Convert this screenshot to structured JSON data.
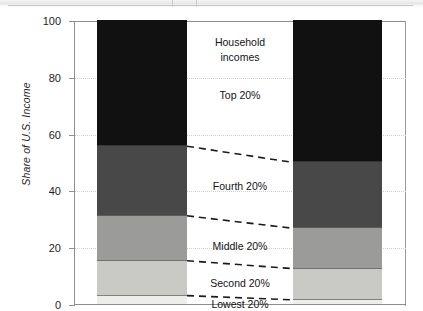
{
  "chart_data": {
    "type": "bar",
    "subtype": "stacked-100-percent",
    "title": "",
    "xlabel": "",
    "ylabel": "Share of U.S. Income",
    "ylim": [
      0,
      100
    ],
    "yticks": [
      0,
      20,
      40,
      60,
      80,
      100
    ],
    "ytick_labels": [
      "0",
      "20",
      "40",
      "60",
      "80",
      "100"
    ],
    "grid": true,
    "grid_style": "dotted-horizontal",
    "legend_position": "inline-center",
    "categories": [
      "",
      ""
    ],
    "series": [
      {
        "name": "Lowest 20%",
        "values": [
          3.3,
          1.8
        ],
        "color": "#ededeb"
      },
      {
        "name": "Second 20%",
        "values": [
          12.3,
          11.0
        ],
        "color": "#c9c9c6"
      },
      {
        "name": "Middle 20%",
        "values": [
          15.8,
          14.2
        ],
        "color": "#9b9b99"
      },
      {
        "name": "Fourth 20%",
        "values": [
          24.5,
          23.2
        ],
        "color": "#484848"
      },
      {
        "name": "Top 20%",
        "values": [
          44.1,
          49.8
        ],
        "color": "#111111"
      }
    ],
    "cumulative_boundaries": {
      "left_bar": [
        3.3,
        15.6,
        31.4,
        55.9,
        100.0
      ],
      "right_bar": [
        1.8,
        12.8,
        27.0,
        50.2,
        100.0
      ]
    },
    "annotations": [
      {
        "id": "household-incomes",
        "text": "Household incomes",
        "y_center": 90
      },
      {
        "id": "top-20",
        "text": "Top 20%",
        "y_center": 74
      },
      {
        "id": "fourth-20",
        "text": "Fourth 20%",
        "y_center": 42
      },
      {
        "id": "middle-20",
        "text": "Middle 20%",
        "y_center": 21
      },
      {
        "id": "second-20",
        "text": "Second 20%",
        "y_center": 8
      },
      {
        "id": "lowest-20",
        "text": "Lowest 20%",
        "y_center": 1
      }
    ],
    "connector_lines": [
      {
        "id": "connector-top",
        "left_y": 55.9,
        "right_y": 50.2
      },
      {
        "id": "connector-fourth",
        "left_y": 31.4,
        "right_y": 27.0
      },
      {
        "id": "connector-middle",
        "left_y": 15.6,
        "right_y": 12.8
      },
      {
        "id": "connector-second",
        "left_y": 3.3,
        "right_y": 1.8
      }
    ]
  },
  "colors": {
    "axis": "#8d8d8d",
    "grid": "#cfcfcf",
    "text": "#141414",
    "connector": "#1a1a1a",
    "background": "#ffffff"
  },
  "axis": {
    "y_label": "Share of U.S. Income",
    "tick_100": "100",
    "tick_80": "80",
    "tick_60": "60",
    "tick_40": "40",
    "tick_20": "20",
    "tick_0": "0"
  },
  "labels": {
    "household_incomes_line1": "Household",
    "household_incomes_line2": "incomes",
    "top": "Top 20%",
    "fourth": "Fourth 20%",
    "middle": "Middle 20%",
    "second": "Second 20%",
    "lowest": "Lowest 20%"
  }
}
